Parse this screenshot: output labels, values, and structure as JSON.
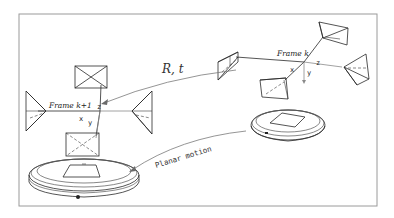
{
  "diagram": {
    "border_color": "#9a9a9a",
    "line_color": "#2a2a2a",
    "frame_k": {
      "label": "Frame k",
      "axes": {
        "x": "x",
        "y": "y",
        "z": "z"
      }
    },
    "frame_k1": {
      "label": "Frame k+1",
      "axes": {
        "x": "x",
        "y": "y",
        "z": "z"
      }
    },
    "transform_label": "R, t",
    "motion_label": "Planar motion",
    "robots": [
      {
        "name": "robot-at-frame-k"
      },
      {
        "name": "robot-at-frame-k+1"
      }
    ]
  }
}
